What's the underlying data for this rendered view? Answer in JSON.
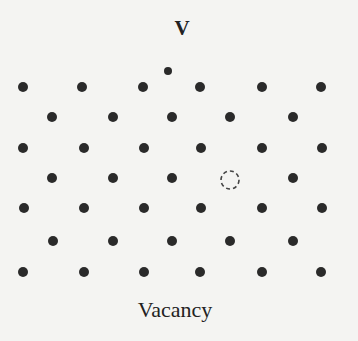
{
  "diagram": {
    "title_label": "V",
    "caption": "Vacancy",
    "colors": {
      "background": "#f4f4f2",
      "atom": "#2a2a2a",
      "vacancy_outline": "#444444"
    },
    "atom_radius": 5,
    "rows": [
      {
        "y": 87,
        "x": [
          23,
          82,
          143,
          200,
          262,
          321
        ]
      },
      {
        "y": 117,
        "x": [
          52,
          113,
          172,
          230,
          293
        ]
      },
      {
        "y": 148,
        "x": [
          23,
          84,
          144,
          201,
          262,
          322
        ]
      },
      {
        "y": 178,
        "x": [
          52,
          113,
          172,
          293
        ]
      },
      {
        "y": 208,
        "x": [
          24,
          84,
          144,
          201,
          262,
          322
        ]
      },
      {
        "y": 241,
        "x": [
          53,
          113,
          172,
          230,
          293
        ]
      },
      {
        "y": 272,
        "x": [
          23,
          84,
          144,
          200,
          262,
          321
        ]
      }
    ],
    "displaced_atom": {
      "x": 168,
      "y": 71,
      "r": 4
    },
    "vacancy_site": {
      "x": 230,
      "y": 180,
      "r": 9
    }
  }
}
